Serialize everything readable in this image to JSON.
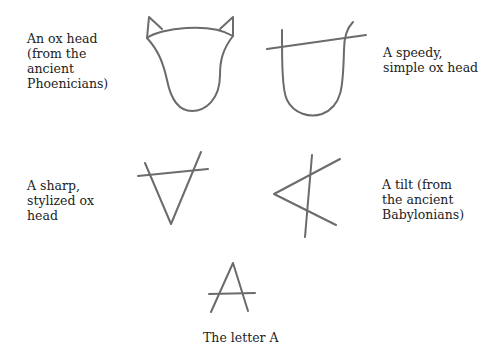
{
  "labels": {
    "phoenician": "An ox head\n(from the\nancient\nPhoenicians)",
    "speedy": "A speedy,\nsimple ox head",
    "sharp": "A sharp,\nstylized ox\nhead",
    "tilt": "A tilt (from\nthe ancient\nBabylonians)",
    "letter": "The letter A"
  },
  "colors": {
    "stroke": "#6b6b6b",
    "text": "#222222",
    "background": "#ffffff"
  }
}
